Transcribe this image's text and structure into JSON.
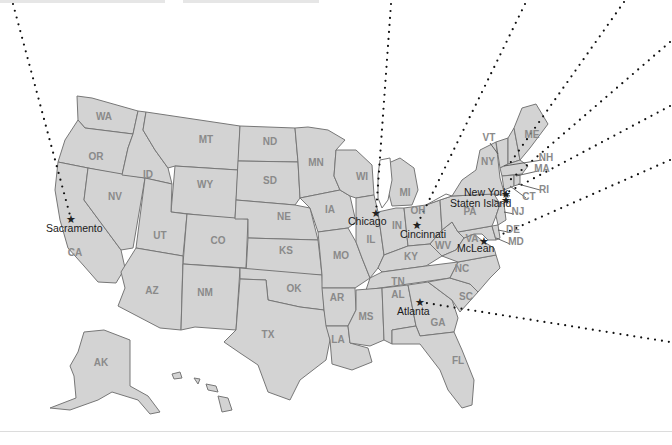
{
  "map": {
    "title": "United States office locations",
    "colors": {
      "land": "#d3d3d3",
      "border": "#777777",
      "abbr": "#8a8a8a",
      "city": "#1a1a1a",
      "leader": "#111111"
    },
    "states": [
      {
        "abbr": "WA",
        "x": 104,
        "y": 120
      },
      {
        "abbr": "OR",
        "x": 96,
        "y": 160
      },
      {
        "abbr": "CA",
        "x": 75,
        "y": 256
      },
      {
        "abbr": "NV",
        "x": 115,
        "y": 200
      },
      {
        "abbr": "ID",
        "x": 148,
        "y": 178
      },
      {
        "abbr": "MT",
        "x": 206,
        "y": 143
      },
      {
        "abbr": "WY",
        "x": 205,
        "y": 188
      },
      {
        "abbr": "UT",
        "x": 160,
        "y": 239
      },
      {
        "abbr": "CO",
        "x": 218,
        "y": 244
      },
      {
        "abbr": "AZ",
        "x": 152,
        "y": 294
      },
      {
        "abbr": "NM",
        "x": 205,
        "y": 296
      },
      {
        "abbr": "ND",
        "x": 270,
        "y": 145
      },
      {
        "abbr": "SD",
        "x": 270,
        "y": 184
      },
      {
        "abbr": "NE",
        "x": 284,
        "y": 220
      },
      {
        "abbr": "KS",
        "x": 286,
        "y": 254
      },
      {
        "abbr": "OK",
        "x": 294,
        "y": 292
      },
      {
        "abbr": "TX",
        "x": 268,
        "y": 338
      },
      {
        "abbr": "MN",
        "x": 316,
        "y": 166
      },
      {
        "abbr": "IA",
        "x": 330,
        "y": 213
      },
      {
        "abbr": "MO",
        "x": 341,
        "y": 259
      },
      {
        "abbr": "AR",
        "x": 337,
        "y": 301
      },
      {
        "abbr": "LA",
        "x": 338,
        "y": 343
      },
      {
        "abbr": "WI",
        "x": 362,
        "y": 180
      },
      {
        "abbr": "IL",
        "x": 371,
        "y": 243
      },
      {
        "abbr": "MI",
        "x": 405,
        "y": 196
      },
      {
        "abbr": "IN",
        "x": 397,
        "y": 229
      },
      {
        "abbr": "OH",
        "x": 418,
        "y": 214
      },
      {
        "abbr": "KY",
        "x": 411,
        "y": 260
      },
      {
        "abbr": "TN",
        "x": 398,
        "y": 285
      },
      {
        "abbr": "MS",
        "x": 366,
        "y": 320
      },
      {
        "abbr": "AL",
        "x": 398,
        "y": 298
      },
      {
        "abbr": "GA",
        "x": 438,
        "y": 326
      },
      {
        "abbr": "FL",
        "x": 458,
        "y": 364
      },
      {
        "abbr": "SC",
        "x": 466,
        "y": 300
      },
      {
        "abbr": "NC",
        "x": 462,
        "y": 272
      },
      {
        "abbr": "WV",
        "x": 443,
        "y": 249
      },
      {
        "abbr": "VA",
        "x": 472,
        "y": 242
      },
      {
        "abbr": "PA",
        "x": 470,
        "y": 215
      },
      {
        "abbr": "NY",
        "x": 488,
        "y": 165
      },
      {
        "abbr": "VT",
        "x": 489,
        "y": 141
      },
      {
        "abbr": "ME",
        "x": 532,
        "y": 138
      },
      {
        "abbr": "NH",
        "x": 546,
        "y": 161
      },
      {
        "abbr": "MA",
        "x": 542,
        "y": 172
      },
      {
        "abbr": "RI",
        "x": 544,
        "y": 193
      },
      {
        "abbr": "CT",
        "x": 529,
        "y": 200
      },
      {
        "abbr": "NJ",
        "x": 518,
        "y": 215
      },
      {
        "abbr": "DE",
        "x": 513,
        "y": 233
      },
      {
        "abbr": "MD",
        "x": 516,
        "y": 245
      },
      {
        "abbr": "AK",
        "x": 101,
        "y": 366
      }
    ],
    "offices": [
      {
        "name": "Sacramento",
        "star_x": 71,
        "star_y": 219,
        "label_x": 46,
        "label_y": 232
      },
      {
        "name": "Chicago",
        "star_x": 376,
        "star_y": 213,
        "label_x": 348,
        "label_y": 225
      },
      {
        "name": "Cincinnati",
        "star_x": 417,
        "star_y": 225,
        "label_x": 400,
        "label_y": 238
      },
      {
        "name": "New York",
        "star_x": 506,
        "star_y": 194,
        "label_x": 464,
        "label_y": 196
      },
      {
        "name": "Staten Island",
        "star_x": 506,
        "star_y": 200,
        "label_x": 450,
        "label_y": 207
      },
      {
        "name": "McLean",
        "star_x": 484,
        "star_y": 241,
        "label_x": 457,
        "label_y": 252
      },
      {
        "name": "Atlanta",
        "star_x": 420,
        "star_y": 302,
        "label_x": 397,
        "label_y": 315
      }
    ]
  }
}
